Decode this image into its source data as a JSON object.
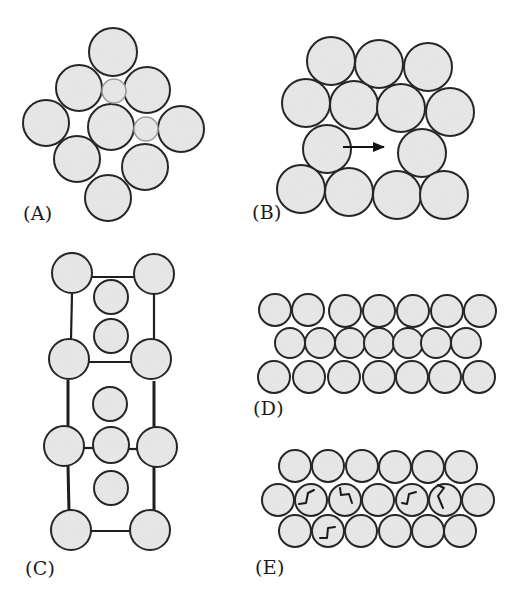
{
  "figure": {
    "width": 521,
    "height": 601,
    "background": "#ffffff",
    "colors": {
      "circle_fill": "#e9e9e9",
      "circle_stroke": "#262626",
      "small_circle_stroke": "#9a9a9a",
      "line": "#1e1e1e",
      "arrow": "#111111",
      "twist_mark": "#1a1a1a"
    }
  },
  "panels": [
    {
      "id": "A",
      "label": "(A)",
      "label_pos": [
        23,
        204
      ],
      "description": "Close-packed cluster of large spheres with two small interstitial spheres",
      "circles": [
        {
          "cx": 113,
          "cy": 52,
          "r": 24
        },
        {
          "cx": 79,
          "cy": 88,
          "r": 23
        },
        {
          "cx": 147,
          "cy": 90,
          "r": 23
        },
        {
          "cx": 46,
          "cy": 123,
          "r": 23
        },
        {
          "cx": 111,
          "cy": 127,
          "r": 23
        },
        {
          "cx": 181,
          "cy": 129,
          "r": 23
        },
        {
          "cx": 77,
          "cy": 159,
          "r": 23
        },
        {
          "cx": 145,
          "cy": 167,
          "r": 23
        },
        {
          "cx": 108,
          "cy": 198,
          "r": 23
        }
      ],
      "small_circles": [
        {
          "cx": 114,
          "cy": 91,
          "r": 12
        },
        {
          "cx": 146,
          "cy": 129,
          "r": 12
        }
      ]
    },
    {
      "id": "B",
      "label": "(B)",
      "label_pos": [
        252,
        203
      ],
      "description": "Packed array with a vacancy; arrow shows sphere moving into vacant site",
      "circles": [
        {
          "cx": 331,
          "cy": 61,
          "r": 24
        },
        {
          "cx": 379,
          "cy": 64,
          "r": 24
        },
        {
          "cx": 428,
          "cy": 67,
          "r": 24
        },
        {
          "cx": 306,
          "cy": 103,
          "r": 24
        },
        {
          "cx": 354,
          "cy": 105,
          "r": 24
        },
        {
          "cx": 401,
          "cy": 108,
          "r": 24
        },
        {
          "cx": 450,
          "cy": 112,
          "r": 24
        },
        {
          "cx": 327,
          "cy": 149,
          "r": 24
        },
        {
          "cx": 422,
          "cy": 153,
          "r": 24
        },
        {
          "cx": 301,
          "cy": 189,
          "r": 24
        },
        {
          "cx": 349,
          "cy": 192,
          "r": 24
        },
        {
          "cx": 397,
          "cy": 195,
          "r": 24
        },
        {
          "cx": 444,
          "cy": 195,
          "r": 24
        }
      ],
      "arrow": {
        "x1": 343,
        "y1": 147,
        "x2": 384,
        "y2": 147,
        "direction": "right"
      }
    },
    {
      "id": "C",
      "label": "(C)",
      "label_pos": [
        25,
        559
      ],
      "description": "Framework (lattice) with guest spheres in channels",
      "circles": [
        {
          "cx": 72,
          "cy": 273,
          "r": 20
        },
        {
          "cx": 154,
          "cy": 274,
          "r": 20
        },
        {
          "cx": 69,
          "cy": 359,
          "r": 20
        },
        {
          "cx": 151,
          "cy": 359,
          "r": 20
        },
        {
          "cx": 64,
          "cy": 446,
          "r": 20
        },
        {
          "cx": 157,
          "cy": 447,
          "r": 20
        },
        {
          "cx": 71,
          "cy": 530,
          "r": 20
        },
        {
          "cx": 150,
          "cy": 530,
          "r": 20
        }
      ],
      "inner_circles": [
        {
          "cx": 111,
          "cy": 297,
          "r": 17
        },
        {
          "cx": 111,
          "cy": 336,
          "r": 17
        },
        {
          "cx": 110,
          "cy": 404,
          "r": 17
        },
        {
          "cx": 111,
          "cy": 445,
          "r": 18
        },
        {
          "cx": 111,
          "cy": 488,
          "r": 17
        }
      ],
      "lines": [
        {
          "x1": 92,
          "y1": 277,
          "x2": 134,
          "y2": 277,
          "w": 2.2
        },
        {
          "x1": 72,
          "y1": 294,
          "x2": 71,
          "y2": 339,
          "w": 2.2
        },
        {
          "x1": 154,
          "y1": 294,
          "x2": 154,
          "y2": 339,
          "w": 2.2
        },
        {
          "x1": 89,
          "y1": 362,
          "x2": 131,
          "y2": 362,
          "w": 2.2
        },
        {
          "x1": 68,
          "y1": 380,
          "x2": 68,
          "y2": 426,
          "w": 3
        },
        {
          "x1": 154,
          "y1": 381,
          "x2": 154,
          "y2": 427,
          "w": 3
        },
        {
          "x1": 84,
          "y1": 448,
          "x2": 94,
          "y2": 448,
          "w": 2.2
        },
        {
          "x1": 129,
          "y1": 449,
          "x2": 138,
          "y2": 449,
          "w": 2.2
        },
        {
          "x1": 68,
          "y1": 466,
          "x2": 69,
          "y2": 511,
          "w": 3
        },
        {
          "x1": 154,
          "y1": 467,
          "x2": 154,
          "y2": 511,
          "w": 3
        },
        {
          "x1": 91,
          "y1": 531,
          "x2": 131,
          "y2": 531,
          "w": 2.2
        }
      ]
    },
    {
      "id": "D",
      "label": "(D)",
      "label_pos": [
        253,
        399
      ],
      "description": "Three rows of close-packed spheres",
      "circles": [
        {
          "cx": 275,
          "cy": 310,
          "r": 16
        },
        {
          "cx": 308,
          "cy": 310,
          "r": 16
        },
        {
          "cx": 345,
          "cy": 311,
          "r": 16
        },
        {
          "cx": 379,
          "cy": 311,
          "r": 16
        },
        {
          "cx": 413,
          "cy": 311,
          "r": 16
        },
        {
          "cx": 447,
          "cy": 311,
          "r": 16
        },
        {
          "cx": 480,
          "cy": 311,
          "r": 16
        },
        {
          "cx": 290,
          "cy": 343,
          "r": 15
        },
        {
          "cx": 320,
          "cy": 343,
          "r": 15
        },
        {
          "cx": 350,
          "cy": 343,
          "r": 15
        },
        {
          "cx": 379,
          "cy": 343,
          "r": 15
        },
        {
          "cx": 408,
          "cy": 343,
          "r": 15
        },
        {
          "cx": 436,
          "cy": 343,
          "r": 15
        },
        {
          "cx": 466,
          "cy": 343,
          "r": 15
        },
        {
          "cx": 274,
          "cy": 377,
          "r": 16
        },
        {
          "cx": 309,
          "cy": 377,
          "r": 16
        },
        {
          "cx": 344,
          "cy": 377,
          "r": 16
        },
        {
          "cx": 379,
          "cy": 377,
          "r": 16
        },
        {
          "cx": 412,
          "cy": 377,
          "r": 16
        },
        {
          "cx": 445,
          "cy": 377,
          "r": 16
        },
        {
          "cx": 479,
          "cy": 377,
          "r": 16
        }
      ]
    },
    {
      "id": "E",
      "label": "(E)",
      "label_pos": [
        255,
        558
      ],
      "description": "Three rows of spheres with rotational/twist marks indicating molecular rotation",
      "circles": [
        {
          "cx": 295,
          "cy": 466,
          "r": 16
        },
        {
          "cx": 328,
          "cy": 466,
          "r": 16
        },
        {
          "cx": 362,
          "cy": 466,
          "r": 16
        },
        {
          "cx": 395,
          "cy": 467,
          "r": 16
        },
        {
          "cx": 428,
          "cy": 467,
          "r": 16
        },
        {
          "cx": 461,
          "cy": 467,
          "r": 16
        },
        {
          "cx": 278,
          "cy": 500,
          "r": 16
        },
        {
          "cx": 311,
          "cy": 500,
          "r": 16
        },
        {
          "cx": 345,
          "cy": 500,
          "r": 16
        },
        {
          "cx": 378,
          "cy": 500,
          "r": 16
        },
        {
          "cx": 412,
          "cy": 500,
          "r": 16
        },
        {
          "cx": 445,
          "cy": 500,
          "r": 16
        },
        {
          "cx": 478,
          "cy": 500,
          "r": 16
        },
        {
          "cx": 295,
          "cy": 531,
          "r": 16
        },
        {
          "cx": 328,
          "cy": 531,
          "r": 16
        },
        {
          "cx": 361,
          "cy": 531,
          "r": 16
        },
        {
          "cx": 395,
          "cy": 531,
          "r": 16
        },
        {
          "cx": 428,
          "cy": 531,
          "r": 16
        },
        {
          "cx": 460,
          "cy": 531,
          "r": 16
        }
      ],
      "twist_marks": [
        {
          "d": "M 299 504 L 306 503 L 308 493 L 314 490"
        },
        {
          "d": "M 340 488 L 341 495 L 349 494 L 352 503"
        },
        {
          "d": "M 402 503 L 407 504 L 409 494 L 416 492"
        },
        {
          "d": "M 438 485 L 444 488 L 438 496 L 443 508"
        },
        {
          "d": "M 320 538 L 327 538 L 328 528 L 335 527"
        }
      ]
    }
  ]
}
